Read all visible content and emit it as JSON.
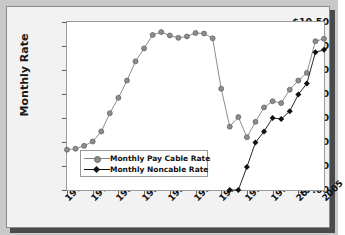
{
  "chart_data": {
    "type": "line",
    "title": "",
    "xlabel": "",
    "ylabel": "Monthly Rate",
    "ylim": [
      7.0,
      10.5
    ],
    "yticks": [
      "$7.00",
      "$7.50",
      "$8.00",
      "$8.50",
      "$9.00",
      "$9.50",
      "$10.00",
      "$10.50"
    ],
    "ytick_values": [
      7.0,
      7.5,
      8.0,
      8.5,
      9.0,
      9.5,
      10.0,
      10.5
    ],
    "xticks": [
      "1975",
      "1978",
      "1981",
      "1984",
      "1987",
      "1990",
      "1993",
      "1996",
      "1999",
      "2002",
      "2005"
    ],
    "xtick_values": [
      1975,
      1978,
      1981,
      1984,
      1987,
      1990,
      1993,
      1996,
      1999,
      2002,
      2005
    ],
    "xlim": [
      1975,
      2005
    ],
    "grid": false,
    "legend_position": "lower-left",
    "x": [
      1975,
      1976,
      1977,
      1978,
      1979,
      1980,
      1981,
      1982,
      1983,
      1984,
      1985,
      1986,
      1987,
      1988,
      1989,
      1990,
      1991,
      1992,
      1993,
      1994,
      1995,
      1996,
      1997,
      1998,
      1999,
      2000,
      2001,
      2002,
      2003,
      2004,
      2005
    ],
    "series": [
      {
        "name": "Monthly Pay Cable Rate",
        "color": "#808080",
        "marker": "circle",
        "x": [
          1975,
          1976,
          1977,
          1978,
          1979,
          1980,
          1981,
          1982,
          1983,
          1984,
          1985,
          1986,
          1987,
          1988,
          1989,
          1990,
          1991,
          1992,
          1993,
          1994,
          1995,
          1996,
          1997,
          1998,
          1999,
          2000,
          2001,
          2002,
          2003,
          2004,
          2005
        ],
        "values": [
          7.84,
          7.86,
          7.92,
          8.01,
          8.22,
          8.6,
          8.92,
          9.28,
          9.68,
          9.95,
          10.23,
          10.29,
          10.22,
          10.17,
          10.2,
          10.27,
          10.26,
          10.16,
          9.11,
          8.32,
          8.52,
          8.1,
          8.42,
          8.72,
          8.85,
          8.81,
          9.09,
          9.28,
          9.44,
          10.1,
          10.15
        ]
      },
      {
        "name": "Monthly Noncable Rate",
        "color": "#111111",
        "marker": "diamond",
        "x": [
          1994,
          1995,
          1996,
          1997,
          1998,
          1999,
          2000,
          2001,
          2002,
          2003,
          2004,
          2005
        ],
        "values": [
          7.0,
          7.0,
          7.48,
          7.99,
          8.22,
          8.5,
          8.48,
          8.64,
          8.99,
          9.22,
          9.87,
          9.92
        ]
      }
    ]
  },
  "legend": {
    "items": [
      {
        "label": "Monthly Pay Cable Rate"
      },
      {
        "label": "Monthly Noncable Rate"
      }
    ]
  }
}
